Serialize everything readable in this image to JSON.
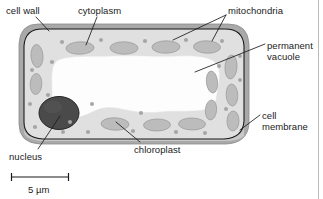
{
  "figure": {
    "background_color": "#ffffff"
  },
  "labels": {
    "cell_wall": "cell wall",
    "cytoplasm": "cytoplasm",
    "mitochondria": "mitochondria",
    "permanent_vacuole": "permanent\nvacuole",
    "permanent_vacuole_line1": "permanent",
    "permanent_vacuole_line2": "vacuole",
    "cell_membrane_line1": "cell",
    "cell_membrane_line2": "membrane",
    "nucleus": "nucleus",
    "chloroplast": "chloroplast"
  },
  "scale_bar": {
    "label": "5 µm",
    "value": 5,
    "unit": "µm",
    "length_px": 57
  },
  "colors": {
    "cell_wall": "#a9a9a9",
    "cell_wall_edge": "#8e8e8e",
    "cytoplasm": "#e0e0e0",
    "cytoplasm_shadow": "#d2d2d2",
    "membrane_line": "#161616",
    "chloroplast_fill": "#bcbcbc",
    "chloroplast_edge": "#9a9a9a",
    "vacuole": "#fdfdfd",
    "nucleus_fill": "#4a4a4a",
    "nucleus_edge": "#2a2a2a",
    "mitochondria_dot": "#a6a6a6",
    "leader_line": "#1b1b1b",
    "text": "#1b1b1b",
    "page_rule": "#b5b5b5"
  },
  "structures": [
    {
      "name": "cell wall",
      "type": "boundary",
      "description": "thick grey outer band surrounding the cell"
    },
    {
      "name": "cell membrane",
      "type": "boundary",
      "description": "thin dark line just inside the cell wall"
    },
    {
      "name": "cytoplasm",
      "type": "region",
      "description": "light grey region between membrane and vacuole"
    },
    {
      "name": "permanent vacuole",
      "type": "organelle",
      "description": "large irregular white space in the cell centre"
    },
    {
      "name": "nucleus",
      "type": "organelle",
      "description": "large dark round body, lower left"
    },
    {
      "name": "chloroplast",
      "type": "organelle",
      "count": 14,
      "description": "grey ovals around the cytoplasm"
    },
    {
      "name": "mitochondria",
      "type": "organelle",
      "count": 22,
      "description": "small grey dots scattered in cytoplasm"
    }
  ]
}
